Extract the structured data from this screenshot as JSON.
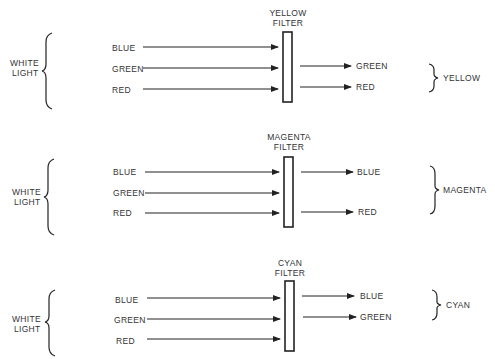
{
  "panels": [
    {
      "id": "yellow",
      "source_label": [
        "WHITE",
        "LIGHT"
      ],
      "filter_label": [
        "YELLOW",
        "FILTER"
      ],
      "inputs": [
        "BLUE",
        "GREEN",
        "RED"
      ],
      "outputs": [
        "GREEN",
        "RED"
      ],
      "result": "YELLOW",
      "y": 0
    },
    {
      "id": "magenta",
      "source_label": [
        "WHITE",
        "LIGHT"
      ],
      "filter_label": [
        "MAGENTA",
        "FILTER"
      ],
      "inputs": [
        "BLUE",
        "GREEN",
        "RED"
      ],
      "outputs": [
        "BLUE",
        "RED"
      ],
      "result": "MAGENTA",
      "y": 120
    },
    {
      "id": "cyan",
      "source_label": [
        "WHITE",
        "LIGHT"
      ],
      "filter_label": [
        "CYAN",
        "FILTER"
      ],
      "inputs": [
        "BLUE",
        "GREEN",
        "RED"
      ],
      "outputs": [
        "BLUE",
        "GREEN"
      ],
      "result": "CYAN",
      "y": 240
    }
  ]
}
